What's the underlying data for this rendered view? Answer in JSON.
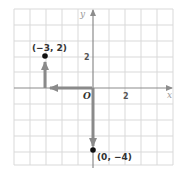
{
  "diagram": {
    "type": "coordinate-plane",
    "grid": {
      "x_range": [
        -5,
        5
      ],
      "y_range": [
        -5,
        5
      ],
      "step": 1
    },
    "axes": {
      "x_label": "x",
      "y_label": "y",
      "origin_label": "O"
    },
    "ticks": {
      "x_tick": "2",
      "y_tick": "2"
    },
    "points": [
      {
        "label": "(−3, 2)",
        "x": -3,
        "y": 2
      },
      {
        "label": "(0, −4)",
        "x": 0,
        "y": -4
      }
    ],
    "arrows": [
      {
        "from": [
          0,
          0
        ],
        "to": [
          -3,
          0
        ],
        "description": "left 3"
      },
      {
        "from": [
          -3,
          0
        ],
        "to": [
          -3,
          2
        ],
        "description": "up 2"
      },
      {
        "from": [
          0,
          0
        ],
        "to": [
          0,
          -4
        ],
        "description": "down 4"
      }
    ],
    "colors": {
      "grid": "#d9d9d9",
      "axis": "#8c8c8c",
      "arrow": "#8a8a8a",
      "point": "#111111"
    }
  }
}
